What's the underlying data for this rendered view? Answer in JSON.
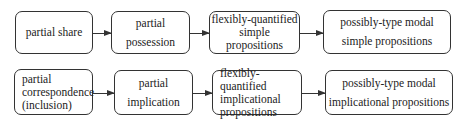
{
  "diagram": {
    "rows": [
      {
        "nodes": [
          {
            "label": "partial share"
          },
          {
            "label": "partial\npossession"
          },
          {
            "label": "flexibly-quantified\nsimple\npropositions"
          },
          {
            "label": "possibly-type modal\nsimple propositions"
          }
        ]
      },
      {
        "nodes": [
          {
            "label": "partial\ncorrespondence\n(inclusion)"
          },
          {
            "label": "partial\nimplication"
          },
          {
            "label": "flexibly-quantified\nimplicational\npropositions"
          },
          {
            "label": "possibly-type modal\nimplicational propositions"
          }
        ]
      }
    ],
    "edges": [
      {
        "from": "partial share",
        "to": "partial possession"
      },
      {
        "from": "partial possession",
        "to": "flexibly-quantified simple propositions"
      },
      {
        "from": "flexibly-quantified simple propositions",
        "to": "possibly-type modal simple propositions"
      },
      {
        "from": "partial correspondence (inclusion)",
        "to": "partial implication"
      },
      {
        "from": "partial implication",
        "to": "flexibly-quantified implicational propositions"
      },
      {
        "from": "flexibly-quantified implicational propositions",
        "to": "possibly-type modal implicational propositions"
      }
    ]
  }
}
